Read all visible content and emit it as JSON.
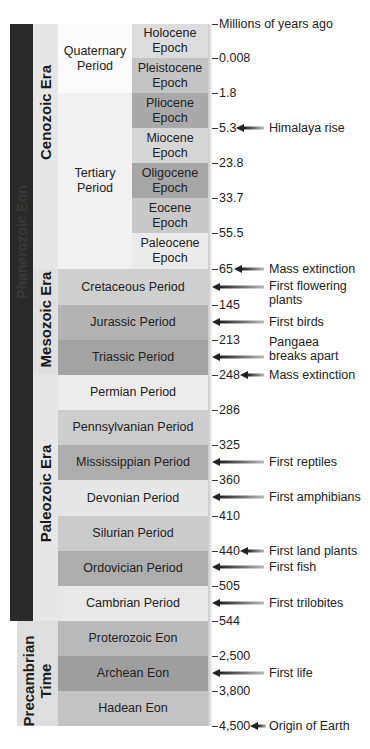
{
  "axis_label": "Millions of years ago",
  "eon": {
    "phanerozoic": "Phanerozoic Eon",
    "precambrian": "Precambrian Time"
  },
  "eras": {
    "cenozoic": "Cenozoic Era",
    "mesozoic": "Mesozoic Era",
    "paleozoic": "Paleozoic Era"
  },
  "cenozoic_periods": {
    "quaternary": "Quaternary Period",
    "tertiary": "Tertiary Period"
  },
  "epochs": [
    {
      "name": "Holocene Epoch",
      "color": "#dcdcdc"
    },
    {
      "name": "Pleistocene Epoch",
      "color": "#c4c4c4"
    },
    {
      "name": "Pliocene Epoch",
      "color": "#a9a9a9"
    },
    {
      "name": "Miocene Epoch",
      "color": "#d6d6d6"
    },
    {
      "name": "Oligocene Epoch",
      "color": "#a6a6a6"
    },
    {
      "name": "Eocene Epoch",
      "color": "#c8c8c8"
    },
    {
      "name": "Paleocene Epoch",
      "color": "#ebebeb"
    }
  ],
  "periods": [
    {
      "name": "Cretaceous Period",
      "color": "#cfcfcf"
    },
    {
      "name": "Jurassic Period",
      "color": "#b3b3b3"
    },
    {
      "name": "Triassic Period",
      "color": "#a3a3a3"
    },
    {
      "name": "Permian Period",
      "color": "#ececec"
    },
    {
      "name": "Pennsylvanian Period",
      "color": "#cdcdcd"
    },
    {
      "name": "Mississippian Period",
      "color": "#adadad"
    },
    {
      "name": "Devonian Period",
      "color": "#e6e6e6"
    },
    {
      "name": "Silurian Period",
      "color": "#cbcbcb"
    },
    {
      "name": "Ordovician Period",
      "color": "#adadad"
    },
    {
      "name": "Cambrian Period",
      "color": "#e8e8e8"
    }
  ],
  "precambrian_eons": [
    {
      "name": "Proterozoic Eon",
      "color": "#b9b9b9"
    },
    {
      "name": "Archean Eon",
      "color": "#9e9e9e"
    },
    {
      "name": "Hadean Eon",
      "color": "#c2c2c2"
    }
  ],
  "ticks": [
    "0.008",
    "1.8",
    "5.3",
    "23.8",
    "33.7",
    "55.5",
    "65",
    "145",
    "213",
    "248",
    "286",
    "325",
    "360",
    "410",
    "440",
    "505",
    "544",
    "2,500",
    "3,800",
    "4,500"
  ],
  "events": [
    {
      "label": "Himalaya rise"
    },
    {
      "label": "Mass extinction"
    },
    {
      "label": "First flowering plants"
    },
    {
      "label": "First birds"
    },
    {
      "label": "Pangaea breaks apart"
    },
    {
      "label": "Mass extinction"
    },
    {
      "label": "First reptiles"
    },
    {
      "label": "First amphibians"
    },
    {
      "label": "First land plants"
    },
    {
      "label": "First fish"
    },
    {
      "label": "First trilobites"
    },
    {
      "label": "First life"
    },
    {
      "label": "Origin of Earth"
    }
  ]
}
